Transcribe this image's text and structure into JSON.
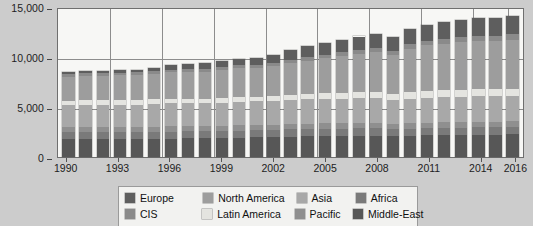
{
  "chart_data": {
    "type": "bar",
    "stacked": true,
    "title": "",
    "subtitle": "",
    "xlabel": "",
    "ylabel": "",
    "ylim": [
      0,
      15000
    ],
    "yticks": [
      0,
      5000,
      10000,
      15000
    ],
    "ytick_labels": [
      "0",
      "5,000",
      "10,000",
      "15,000"
    ],
    "grid": true,
    "legend_position": "bottom",
    "categories": [
      "1990",
      "1991",
      "1992",
      "1993",
      "1994",
      "1995",
      "1996",
      "1997",
      "1998",
      "1999",
      "2000",
      "2001",
      "2002",
      "2003",
      "2004",
      "2005",
      "2006",
      "2007",
      "2008",
      "2009",
      "2010",
      "2011",
      "2012",
      "2013",
      "2014",
      "2015",
      "2016"
    ],
    "xtick_labels": [
      "1990",
      "1993",
      "1996",
      "1999",
      "2002",
      "2005",
      "2008",
      "2011",
      "2014",
      "2016"
    ],
    "series": [
      {
        "name": "Middle-East",
        "color": "#575757",
        "values": [
          1800,
          1820,
          1800,
          1800,
          1800,
          1820,
          1850,
          1860,
          1860,
          1900,
          1950,
          1980,
          2000,
          2050,
          2080,
          2100,
          2120,
          2150,
          2150,
          2100,
          2150,
          2180,
          2200,
          2220,
          2250,
          2250,
          2280
        ]
      },
      {
        "name": "Africa",
        "color": "#7a7a7a",
        "values": [
          700,
          700,
          700,
          700,
          700,
          700,
          700,
          700,
          700,
          700,
          700,
          700,
          700,
          720,
          720,
          720,
          720,
          720,
          720,
          700,
          720,
          720,
          720,
          720,
          730,
          730,
          730
        ]
      },
      {
        "name": "Pacific",
        "color": "#8f8f8f",
        "values": [
          500,
          500,
          500,
          500,
          500,
          500,
          520,
          520,
          520,
          520,
          530,
          530,
          530,
          540,
          540,
          540,
          540,
          540,
          540,
          520,
          540,
          540,
          550,
          550,
          550,
          550,
          550
        ]
      },
      {
        "name": "Asia",
        "color": "#a8a8a8",
        "values": [
          2200,
          2220,
          2230,
          2250,
          2250,
          2280,
          2300,
          2300,
          2300,
          2320,
          2350,
          2350,
          2380,
          2400,
          2420,
          2450,
          2450,
          2480,
          2480,
          2400,
          2480,
          2500,
          2520,
          2520,
          2550,
          2550,
          2550
        ]
      },
      {
        "name": "Latin America",
        "color": "#e4e4e0",
        "values": [
          450,
          450,
          450,
          450,
          450,
          460,
          470,
          470,
          470,
          480,
          490,
          490,
          500,
          520,
          540,
          560,
          580,
          600,
          620,
          600,
          650,
          680,
          700,
          700,
          720,
          720,
          720
        ]
      },
      {
        "name": "North America",
        "color": "#9d9d9d",
        "values": [
          2400,
          2450,
          2450,
          2480,
          2520,
          2580,
          2650,
          2680,
          2680,
          2780,
          2880,
          2900,
          2950,
          3150,
          3350,
          3500,
          3650,
          3800,
          3950,
          3900,
          4350,
          4550,
          4650,
          4750,
          4800,
          4820,
          4900
        ]
      },
      {
        "name": "CIS",
        "color": "#8a8a8a",
        "values": [
          250,
          250,
          250,
          250,
          250,
          260,
          260,
          270,
          270,
          280,
          290,
          300,
          320,
          340,
          360,
          380,
          400,
          420,
          440,
          430,
          460,
          480,
          500,
          510,
          520,
          520,
          530
        ]
      },
      {
        "name": "Europe",
        "color": "#5e5e5e",
        "values": [
          200,
          210,
          220,
          250,
          280,
          350,
          500,
          550,
          570,
          620,
          650,
          700,
          800,
          950,
          1050,
          1150,
          1250,
          1350,
          1450,
          1400,
          1550,
          1600,
          1650,
          1700,
          1750,
          1750,
          1800
        ]
      }
    ],
    "totals": [
      8500,
      8600,
      8600,
      8680,
      8750,
      8950,
      9250,
      9350,
      9370,
      9600,
      9840,
      9950,
      10180,
      10670,
      11060,
      11400,
      11710,
      12060,
      12350,
      12050,
      12800,
      13250,
      13490,
      13670,
      13870,
      13890,
      14060
    ]
  },
  "legend": {
    "rows": [
      [
        {
          "label": "Europe",
          "color": "#5e5e5e"
        },
        {
          "label": "North America",
          "color": "#9d9d9d"
        },
        {
          "label": "Asia",
          "color": "#a8a8a8"
        },
        {
          "label": "Africa",
          "color": "#7a7a7a"
        }
      ],
      [
        {
          "label": "CIS",
          "color": "#8a8a8a"
        },
        {
          "label": "Latin America",
          "color": "#e4e4e0"
        },
        {
          "label": "Pacific",
          "color": "#8f8f8f"
        },
        {
          "label": "Middle-East",
          "color": "#575757"
        }
      ]
    ]
  }
}
